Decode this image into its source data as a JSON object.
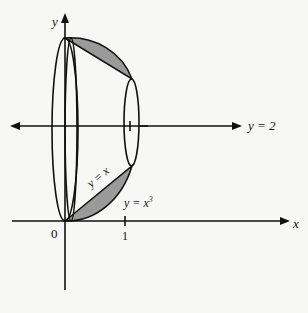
{
  "diagram": {
    "axes": {
      "x_label": "x",
      "y_label": "y",
      "origin_label": "0",
      "tick_x": "1"
    },
    "lines": {
      "axis_of_rotation": "y = 2"
    },
    "curves": {
      "line": "y = x",
      "cubic": "y = x",
      "cubic_exp": "3"
    },
    "colors": {
      "shade": "#9a9a9a",
      "stroke": "#111111",
      "background": "#f7f7f5"
    }
  }
}
